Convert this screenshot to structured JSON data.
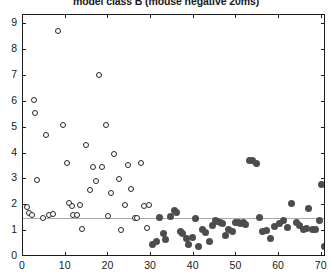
{
  "chart_data": {
    "type": "scatter",
    "title": "model class B (mouse negative 20ms)",
    "xlabel": "",
    "ylabel": "",
    "xlim": [
      0,
      71
    ],
    "ylim": [
      0,
      9.35
    ],
    "grid": false,
    "legend": null,
    "xticks": [
      0,
      10,
      20,
      30,
      40,
      50,
      60,
      70
    ],
    "xtick_labels": [
      "0",
      "10",
      "20",
      "30",
      "40",
      "50",
      "60",
      "70"
    ],
    "yticks": [
      0,
      1,
      2,
      3,
      4,
      5,
      6,
      7,
      8,
      9
    ],
    "ytick_labels": [
      "0",
      "1",
      "2",
      "3",
      "4",
      "5",
      "6",
      "7",
      "8",
      "9"
    ],
    "annotations": [
      {
        "type": "hline",
        "y": 1.5,
        "color": "#aaaaaa",
        "label": "reference line"
      }
    ],
    "series": [
      {
        "name": "open-circle-group",
        "marker": "open-circle",
        "color": "#262626",
        "points": [
          [
            1.0,
            1.95
          ],
          [
            1.4,
            1.72
          ],
          [
            2.0,
            1.62
          ],
          [
            2.6,
            6.05
          ],
          [
            2.8,
            5.55
          ],
          [
            3.2,
            2.98
          ],
          [
            4.6,
            1.52
          ],
          [
            5.4,
            4.72
          ],
          [
            6.0,
            1.62
          ],
          [
            7.0,
            1.68
          ],
          [
            8.2,
            8.72
          ],
          [
            9.4,
            5.12
          ],
          [
            10.2,
            3.62
          ],
          [
            10.8,
            2.08
          ],
          [
            11.4,
            1.98
          ],
          [
            11.8,
            1.62
          ],
          [
            12.6,
            1.62
          ],
          [
            13.4,
            2.02
          ],
          [
            13.8,
            1.08
          ],
          [
            14.8,
            4.32
          ],
          [
            15.6,
            2.58
          ],
          [
            16.4,
            3.48
          ],
          [
            17.2,
            2.92
          ],
          [
            17.8,
            7.02
          ],
          [
            18.6,
            3.48
          ],
          [
            19.4,
            5.12
          ],
          [
            20.0,
            1.58
          ],
          [
            20.6,
            2.48
          ],
          [
            21.4,
            3.98
          ],
          [
            22.4,
            3.02
          ],
          [
            23.0,
            1.05
          ],
          [
            23.8,
            2.02
          ],
          [
            24.6,
            3.55
          ],
          [
            25.4,
            2.62
          ],
          [
            26.2,
            1.52
          ],
          [
            26.8,
            1.52
          ],
          [
            27.6,
            3.62
          ],
          [
            28.4,
            1.98
          ],
          [
            29.0,
            1.12
          ],
          [
            29.6,
            2.02
          ]
        ]
      },
      {
        "name": "filled-circle-group",
        "marker": "filled-circle",
        "color": "#4d4d4d",
        "points": [
          [
            30.4,
            0.48
          ],
          [
            31.2,
            0.62
          ],
          [
            32.0,
            1.52
          ],
          [
            32.8,
            0.92
          ],
          [
            33.4,
            0.68
          ],
          [
            34.6,
            1.55
          ],
          [
            35.4,
            1.78
          ],
          [
            36.0,
            1.72
          ],
          [
            36.8,
            0.98
          ],
          [
            37.4,
            0.92
          ],
          [
            38.2,
            0.72
          ],
          [
            38.8,
            0.48
          ],
          [
            39.6,
            0.75
          ],
          [
            40.4,
            1.48
          ],
          [
            41.0,
            0.42
          ],
          [
            42.0,
            1.05
          ],
          [
            42.8,
            0.95
          ],
          [
            43.6,
            0.62
          ],
          [
            44.4,
            1.22
          ],
          [
            45.0,
            1.42
          ],
          [
            45.6,
            1.38
          ],
          [
            46.2,
            1.35
          ],
          [
            46.8,
            1.28
          ],
          [
            47.4,
            0.85
          ],
          [
            48.2,
            1.08
          ],
          [
            49.0,
            0.98
          ],
          [
            49.8,
            1.32
          ],
          [
            50.4,
            1.35
          ],
          [
            51.0,
            1.28
          ],
          [
            51.6,
            1.32
          ],
          [
            52.2,
            1.25
          ],
          [
            53.0,
            3.72
          ],
          [
            53.8,
            3.72
          ],
          [
            54.6,
            3.62
          ],
          [
            55.4,
            1.52
          ],
          [
            56.2,
            0.98
          ],
          [
            57.0,
            1.02
          ],
          [
            58.0,
            0.72
          ],
          [
            59.0,
            1.18
          ],
          [
            60.0,
            1.28
          ],
          [
            61.0,
            1.42
          ],
          [
            62.0,
            1.15
          ],
          [
            63.0,
            2.08
          ],
          [
            64.0,
            1.35
          ],
          [
            64.8,
            1.22
          ],
          [
            65.6,
            1.05
          ],
          [
            66.4,
            1.12
          ],
          [
            67.0,
            1.88
          ],
          [
            67.8,
            1.05
          ],
          [
            68.6,
            1.08
          ],
          [
            69.4,
            1.42
          ],
          [
            70.0,
            2.82
          ],
          [
            70.6,
            0.42
          ]
        ]
      }
    ]
  }
}
